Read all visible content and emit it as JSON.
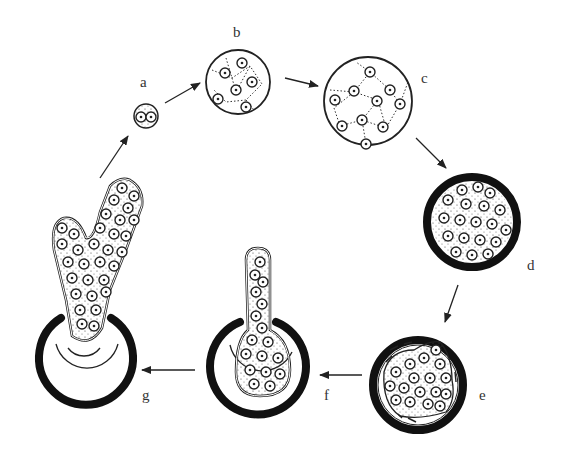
{
  "diagram": {
    "type": "cycle",
    "stages": [
      {
        "id": "a",
        "label": "a",
        "description": "small cell with two nuclei"
      },
      {
        "id": "b",
        "label": "b",
        "description": "larger cell with several nuclei and dotted network"
      },
      {
        "id": "c",
        "label": "c",
        "description": "large cell with many nuclei and dotted network"
      },
      {
        "id": "d",
        "label": "d",
        "description": "cell with thick dark wall, densely packed nuclei"
      },
      {
        "id": "e",
        "label": "e",
        "description": "thick-walled cell with contracted inner mass of nuclei"
      },
      {
        "id": "f",
        "label": "f",
        "description": "elongated outgrowth emerging through opened wall"
      },
      {
        "id": "g",
        "label": "g",
        "description": "branched outgrowth emerging from ruptured wall"
      }
    ],
    "arrows": [
      {
        "from": "a",
        "to": "b"
      },
      {
        "from": "b",
        "to": "c"
      },
      {
        "from": "c",
        "to": "d"
      },
      {
        "from": "d",
        "to": "e"
      },
      {
        "from": "e",
        "to": "f"
      },
      {
        "from": "f",
        "to": "g"
      },
      {
        "from": "g",
        "to": "a"
      }
    ]
  }
}
